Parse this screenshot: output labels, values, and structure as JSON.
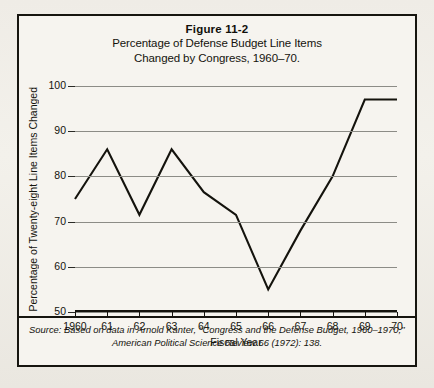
{
  "figure": {
    "label": "Figure 11-2",
    "subtitle_line1": "Percentage of Defense Budget Line Items",
    "subtitle_line2": "Changed by Congress, 1960–70."
  },
  "source": {
    "prefix": "Source:",
    "line1": "Based on data in Arnold Kanter, ‘‘Congress and the Defense Budget, 1960–1970,’’",
    "line2": "American Political Science Review 66 (1972): 138."
  },
  "colors": {
    "line": "#14130d",
    "grid": "#8c8c86",
    "axis": "#14130d",
    "frame": "#16150f",
    "paper": "#f6f4ef"
  },
  "chart_data": {
    "type": "line",
    "xlabel": "Fiscal Year",
    "ylabel": "Percentage of Twenty-eight Line Items Changed",
    "x": [
      1960,
      1961,
      1962,
      1963,
      1964,
      1965,
      1966,
      1967,
      1968,
      1969,
      1970
    ],
    "xtick_labels": [
      "1960",
      "61",
      "62",
      "63",
      "64",
      "65",
      "66",
      "67",
      "68",
      "69",
      "70"
    ],
    "ytick_labels": [
      "50",
      "60",
      "70",
      "80",
      "90",
      "100"
    ],
    "yticks": [
      50,
      60,
      70,
      80,
      90,
      100
    ],
    "ylim": [
      50,
      100
    ],
    "xlim": [
      1960,
      1970
    ],
    "grid": true,
    "legend": false,
    "values": [
      75,
      86,
      71.5,
      86,
      76.5,
      71.5,
      55,
      68,
      80,
      97,
      97
    ]
  }
}
